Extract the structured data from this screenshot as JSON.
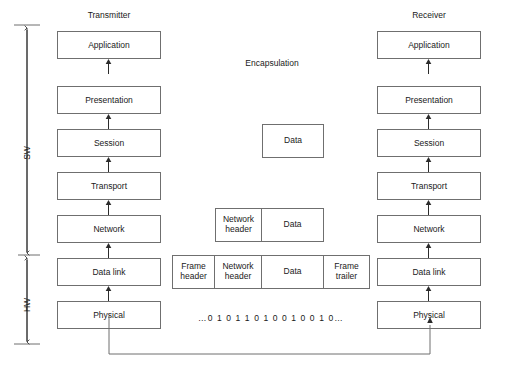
{
  "diagram": {
    "titles": {
      "transmitter": "Transmitter",
      "receiver": "Receiver",
      "encapsulation": "Encapsulation"
    },
    "layers": [
      {
        "label": "Application"
      },
      {
        "label": "Presentation"
      },
      {
        "label": "Session"
      },
      {
        "label": "Transport"
      },
      {
        "label": "Network"
      },
      {
        "label": "Data link"
      },
      {
        "label": "Physical"
      }
    ],
    "brackets": [
      {
        "name": "software",
        "label": "SW"
      },
      {
        "name": "hardware",
        "label": "HW"
      }
    ],
    "encapsulation_rows": [
      {
        "name": "session-data",
        "cells": [
          {
            "name": "data",
            "label": "Data",
            "width": 62
          }
        ]
      },
      {
        "name": "network-packet",
        "cells": [
          {
            "name": "network-header",
            "label": "Network\nheader",
            "width": 47
          },
          {
            "name": "data",
            "label": "Data",
            "width": 62
          }
        ]
      },
      {
        "name": "data-link-frame",
        "cells": [
          {
            "name": "frame-header",
            "label": "Frame\nheader",
            "width": 43
          },
          {
            "name": "network-header",
            "label": "Network\nheader",
            "width": 47
          },
          {
            "name": "data",
            "label": "Data",
            "width": 62
          },
          {
            "name": "frame-trailer",
            "label": "Frame\ntrailer",
            "width": 46
          }
        ]
      }
    ],
    "bitstream": "…0 1 0 1 1 0 1 0 0 1 0 0 1 0…",
    "colors": {
      "border": "#6f6f6f",
      "text": "#1a1a1a",
      "arrow": "#2b2b2b",
      "background": "#ffffff"
    }
  }
}
